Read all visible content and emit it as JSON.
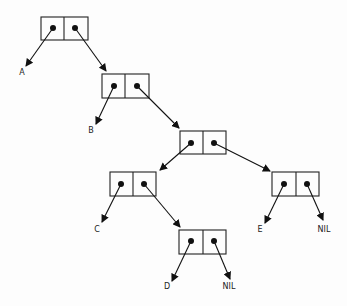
{
  "diagram": {
    "type": "cons-cell box-and-pointer diagram",
    "cells": [
      {
        "id": "cell1",
        "x": 41,
        "y": 17
      },
      {
        "id": "cell2",
        "x": 102,
        "y": 74
      },
      {
        "id": "cell3",
        "x": 180,
        "y": 131
      },
      {
        "id": "cell4",
        "x": 110,
        "y": 172
      },
      {
        "id": "cell5",
        "x": 272,
        "y": 172
      },
      {
        "id": "cell6",
        "x": 179,
        "y": 230
      }
    ],
    "labels": {
      "a": "A",
      "b": "B",
      "c": "C",
      "d": "D",
      "e": "E",
      "nil1": "NIL",
      "nil2": "NIL"
    }
  }
}
